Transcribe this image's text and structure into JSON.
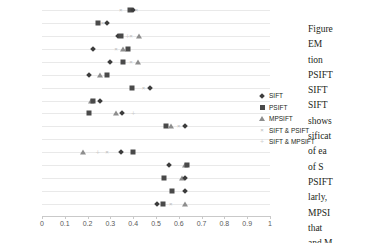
{
  "chart_data": {
    "type": "scatter",
    "title": "",
    "xlabel": "",
    "ylabel": "",
    "xlim": [
      0,
      1
    ],
    "ylim_categories_top_to_bottom": [
      "μ",
      "ω15",
      "ω14",
      "ω13",
      "ω12",
      "ω11",
      "ω10",
      "ω9",
      "ω8",
      "ω7",
      "ω6",
      "ω5",
      "ω4",
      "ω3",
      "ω2",
      "ω1"
    ],
    "xticks": [
      0,
      0.1,
      0.2,
      0.3,
      0.4,
      0.5,
      0.6,
      0.7,
      0.8,
      0.9,
      1
    ],
    "xtick_labels": [
      "0",
      "0.1",
      "0.2",
      "0.3",
      "0.4",
      "0.5",
      "0.6",
      "0.7",
      "0.8",
      "0.9",
      "1"
    ],
    "grid": true,
    "legend_position": "right",
    "legend": [
      "SIFT",
      "PSIFT",
      "MPSIFT",
      "SIFT & PSIFT",
      "SIFT & MPSIFT"
    ],
    "series": [
      {
        "name": "SIFT",
        "marker": "diamond",
        "values": [
          0.4,
          0.28,
          0.34,
          0.22,
          0.29,
          0.2,
          0.41,
          0.25,
          0.37,
          0.6,
          null,
          0.35,
          0.59,
          0.62,
          null,
          0.51
        ]
      },
      {
        "name": "PSIFT",
        "marker": "square",
        "values": [
          0.385,
          0.245,
          0.325,
          0.345,
          0.345,
          0.245,
          0.395,
          0.235,
          0.205,
          0.545,
          null,
          0.395,
          0.625,
          0.535,
          0.57,
          0.535
        ]
      },
      {
        "name": "MPSIFT",
        "marker": "triangle",
        "values": [
          null,
          null,
          0.385,
          0.335,
          0.375,
          0.225,
          null,
          0.235,
          0.33,
          0.585,
          null,
          0.18,
          0.63,
          0.615,
          0.575,
          0.585
        ]
      },
      {
        "name": "SIFT & PSIFT",
        "marker": "x",
        "values": [
          0.41,
          0.265,
          0.355,
          0.305,
          0.36,
          null,
          0.425,
          null,
          null,
          0.575,
          null,
          0.245,
          null,
          null,
          null,
          0.555
        ]
      },
      {
        "name": "SIFT & MPSIFT",
        "marker": "plus",
        "values": [
          null,
          null,
          0.355,
          null,
          null,
          null,
          null,
          null,
          0.4,
          null,
          null,
          0.285,
          null,
          null,
          null,
          null
        ]
      }
    ],
    "rows": [
      {
        "label": "μ",
        "sub": "",
        "points": [
          {
            "series": "SIFT & PSIFT",
            "x": 0.345
          },
          {
            "series": "PSIFT",
            "x": 0.385
          },
          {
            "series": "SIFT",
            "x": 0.4
          },
          {
            "series": "SIFT & PSIFT",
            "x": 0.415
          }
        ]
      },
      {
        "label": "ω",
        "sub": "15",
        "points": [
          {
            "series": "PSIFT",
            "x": 0.245
          },
          {
            "series": "SIFT & PSIFT",
            "x": 0.265
          },
          {
            "series": "SIFT",
            "x": 0.285
          }
        ]
      },
      {
        "label": "ω",
        "sub": "14",
        "points": [
          {
            "series": "SIFT",
            "x": 0.335
          },
          {
            "series": "PSIFT",
            "x": 0.345
          },
          {
            "series": "SIFT & MPSIFT",
            "x": 0.375
          },
          {
            "series": "SIFT & PSIFT",
            "x": 0.39
          },
          {
            "series": "MPSIFT",
            "x": 0.425
          }
        ]
      },
      {
        "label": "ω",
        "sub": "13",
        "points": [
          {
            "series": "SIFT",
            "x": 0.225
          },
          {
            "series": "SIFT & PSIFT",
            "x": 0.325
          },
          {
            "series": "MPSIFT",
            "x": 0.355
          },
          {
            "series": "PSIFT",
            "x": 0.375
          }
        ]
      },
      {
        "label": "ω",
        "sub": "12",
        "points": [
          {
            "series": "SIFT",
            "x": 0.3
          },
          {
            "series": "PSIFT",
            "x": 0.355
          },
          {
            "series": "SIFT & PSIFT",
            "x": 0.39
          },
          {
            "series": "MPSIFT",
            "x": 0.42
          }
        ]
      },
      {
        "label": "ω",
        "sub": "11",
        "points": [
          {
            "series": "SIFT",
            "x": 0.205
          },
          {
            "series": "MPSIFT",
            "x": 0.255
          },
          {
            "series": "PSIFT",
            "x": 0.285
          }
        ]
      },
      {
        "label": "ω",
        "sub": "10",
        "points": [
          {
            "series": "PSIFT",
            "x": 0.395
          },
          {
            "series": "SIFT & PSIFT",
            "x": 0.445
          },
          {
            "series": "SIFT",
            "x": 0.475
          }
        ]
      },
      {
        "label": "ω",
        "sub": "9",
        "points": [
          {
            "series": "MPSIFT",
            "x": 0.215
          },
          {
            "series": "PSIFT",
            "x": 0.225
          },
          {
            "series": "SIFT",
            "x": 0.255
          }
        ]
      },
      {
        "label": "ω",
        "sub": "8",
        "points": [
          {
            "series": "PSIFT",
            "x": 0.205
          },
          {
            "series": "MPSIFT",
            "x": 0.325
          },
          {
            "series": "SIFT",
            "x": 0.35
          },
          {
            "series": "SIFT & MPSIFT",
            "x": 0.4
          }
        ]
      },
      {
        "label": "ω",
        "sub": "7",
        "points": [
          {
            "series": "PSIFT",
            "x": 0.545
          },
          {
            "series": "MPSIFT",
            "x": 0.565
          },
          {
            "series": "SIFT & PSIFT",
            "x": 0.6
          },
          {
            "series": "SIFT",
            "x": 0.625
          }
        ]
      },
      {
        "label": "ω",
        "sub": "6",
        "points": []
      },
      {
        "label": "ω",
        "sub": "5",
        "points": [
          {
            "series": "MPSIFT",
            "x": 0.18
          },
          {
            "series": "SIFT & MPSIFT",
            "x": 0.245
          },
          {
            "series": "SIFT & PSIFT",
            "x": 0.285
          },
          {
            "series": "SIFT",
            "x": 0.345
          },
          {
            "series": "PSIFT",
            "x": 0.4
          }
        ]
      },
      {
        "label": "ω",
        "sub": "4",
        "points": [
          {
            "series": "SIFT",
            "x": 0.555
          },
          {
            "series": "MPSIFT",
            "x": 0.625
          },
          {
            "series": "PSIFT",
            "x": 0.635
          }
        ]
      },
      {
        "label": "ω",
        "sub": "3",
        "points": [
          {
            "series": "PSIFT",
            "x": 0.535
          },
          {
            "series": "MPSIFT",
            "x": 0.615
          },
          {
            "series": "SIFT",
            "x": 0.625
          }
        ]
      },
      {
        "label": "ω",
        "sub": "2",
        "points": [
          {
            "series": "PSIFT",
            "x": 0.57
          },
          {
            "series": "SIFT",
            "x": 0.625
          }
        ]
      },
      {
        "label": "ω",
        "sub": "1",
        "points": [
          {
            "series": "SIFT",
            "x": 0.505
          },
          {
            "series": "PSIFT",
            "x": 0.53
          },
          {
            "series": "SIFT & PSIFT",
            "x": 0.565
          },
          {
            "series": "MPSIFT",
            "x": 0.625
          }
        ]
      }
    ]
  },
  "legend": {
    "items": [
      {
        "label": "SIFT",
        "marker": "diamond"
      },
      {
        "label": "PSIFT",
        "marker": "square"
      },
      {
        "label": "MPSIFT",
        "marker": "triangle"
      },
      {
        "label": "SIFT & PSIFT",
        "marker": "x"
      },
      {
        "label": "SIFT & MPSIFT",
        "marker": "plus"
      }
    ]
  },
  "body_text": {
    "lines": [
      "Figure",
      "EM",
      "tion",
      "PSIFT",
      "SIFT",
      "SIFT",
      "shows",
      "sificat",
      "of ea",
      "of   S",
      "PSIFT",
      "larly,",
      "MPSI",
      "that",
      "and M"
    ]
  }
}
